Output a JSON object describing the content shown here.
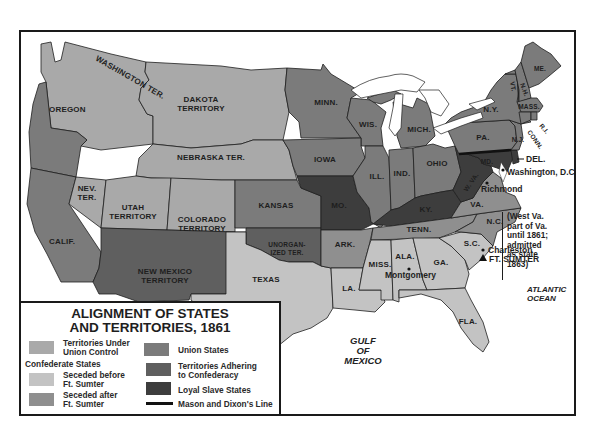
{
  "legend": {
    "title_line1": "ALIGNMENT OF STATES",
    "title_line2": "AND TERRITORIES, 1861",
    "items": [
      {
        "label_1": "Territories Under",
        "label_2": "Union Control",
        "color": "#a9a9a9"
      },
      {
        "label_1": "Union States",
        "label_2": "",
        "color": "#7b7b7b"
      },
      {
        "label_1": "Territories Adhering",
        "label_2": "to Confederacy",
        "color": "#5f5f5f"
      },
      {
        "label_1": "Loyal Slave States",
        "label_2": "",
        "color": "#3d3d3d"
      },
      {
        "label_1": "Mason and Dixon's Line",
        "label_2": "",
        "color": "#111111"
      }
    ],
    "confederate_heading": "Confederate States",
    "confederate_items": [
      {
        "label_1": "Seceded before",
        "label_2": "Ft. Sumter",
        "color": "#c3c3c3"
      },
      {
        "label_1": "Seceded after",
        "label_2": "Ft. Sumter",
        "color": "#8f8f8f"
      }
    ]
  },
  "colors": {
    "union_territory": "#a9a9a9",
    "union_state": "#7b7b7b",
    "confed_territory": "#5f5f5f",
    "loyal_slave": "#3d3d3d",
    "seceded_before": "#c3c3c3",
    "seceded_after": "#8f8f8f"
  },
  "regions": {
    "washington": "WASHINGTON TER.",
    "oregon": "OREGON",
    "dakota_1": "DAKOTA",
    "dakota_2": "TERRITORY",
    "nebraska": "NEBRASKA TER.",
    "nevada_1": "NEV.",
    "nevada_2": "TER.",
    "utah_1": "UTAH",
    "utah_2": "TERRITORY",
    "colorado_1": "COLORADO",
    "colorado_2": "TERRITORY",
    "california": "CALIF.",
    "newmexico_1": "NEW MEXICO",
    "newmexico_2": "TERRITORY",
    "kansas": "KANSAS",
    "unorganized_1": "UNORGAN-",
    "unorganized_2": "IZED TER.",
    "texas": "TEXAS",
    "minnesota": "MINN.",
    "wisconsin": "WIS.",
    "iowa": "IOWA",
    "missouri": "MO.",
    "arkansas": "ARK.",
    "louisiana": "LA.",
    "illinois": "ILL.",
    "indiana": "IND.",
    "michigan": "MICH.",
    "ohio": "OHIO",
    "kentucky": "KY.",
    "tennessee": "TENN.",
    "mississippi": "MISS.",
    "alabama": "ALA.",
    "georgia": "GA.",
    "florida": "FLA.",
    "south_carolina": "S.C.",
    "north_carolina": "N.C.",
    "virginia": "VA.",
    "west_virginia": "W. VA.",
    "maryland": "MD.",
    "delaware": "DEL.",
    "pennsylvania": "PA.",
    "new_jersey": "N.J.",
    "new_york": "N.Y.",
    "vermont": "VT.",
    "new_hampshire": "N.H.",
    "maine": "ME.",
    "massachusetts": "MASS.",
    "rhode_island": "R.I.",
    "connecticut": "CONN."
  },
  "cities": {
    "washington_dc": "Washington, D.C.",
    "richmond": "Richmond",
    "montgomery": "Montgomery",
    "charleston": "Charleston",
    "fort_sumter": "FT. SUMTER"
  },
  "water": {
    "gulf_1": "GULF",
    "gulf_2": "OF",
    "gulf_3": "MEXICO",
    "atlantic_1": "ATLANTIC",
    "atlantic_2": "OCEAN"
  },
  "note": {
    "line1": "(West Va.",
    "line2": "part of Va.",
    "line3": "until 1861;",
    "line4": "admitted",
    "line5": "as state",
    "line6": "1863)"
  }
}
